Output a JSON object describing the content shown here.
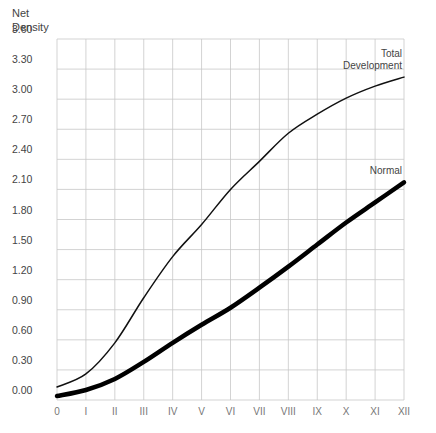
{
  "chart_data": {
    "type": "line",
    "title": "",
    "xlabel": "",
    "ylabel": "Net Density",
    "ylabel_lines": [
      "Net",
      "Density"
    ],
    "categories": [
      "0",
      "I",
      "II",
      "III",
      "IV",
      "V",
      "VI",
      "VII",
      "VIII",
      "IX",
      "X",
      "XI",
      "XII"
    ],
    "yticks": [
      "0.00",
      "0.30",
      "0.60",
      "0.90",
      "1.20",
      "1.50",
      "1.80",
      "2.10",
      "2.40",
      "2.70",
      "3.00",
      "3.30",
      "3.60"
    ],
    "ylim": [
      0,
      3.6
    ],
    "grid": true,
    "legend": "inline labels at right end of curves",
    "series": [
      {
        "name": "Total Development",
        "label_lines": [
          "Total",
          "Development"
        ],
        "values": [
          0.13,
          0.26,
          0.57,
          1.02,
          1.43,
          1.75,
          2.1,
          2.38,
          2.66,
          2.85,
          3.01,
          3.13,
          3.22
        ],
        "stroke_width": 1.5,
        "color": "#111111"
      },
      {
        "name": "Normal",
        "label_lines": [
          "Normal"
        ],
        "values": [
          0.04,
          0.1,
          0.21,
          0.38,
          0.57,
          0.75,
          0.92,
          1.12,
          1.33,
          1.55,
          1.77,
          1.97,
          2.17
        ],
        "stroke_width": 4.5,
        "color": "#000000"
      }
    ]
  },
  "colors": {
    "grid": "#c8c8c8",
    "axis_text": "#444444",
    "background": "#ffffff"
  }
}
